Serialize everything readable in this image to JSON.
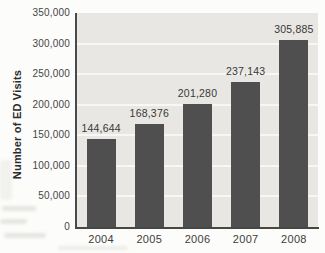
{
  "chart_data": {
    "type": "bar",
    "title": "",
    "categories": [
      "2004",
      "2005",
      "2006",
      "2007",
      "2008"
    ],
    "values": [
      144644,
      168376,
      201280,
      237143,
      305885
    ],
    "value_labels": [
      "144,644",
      "168,376",
      "201,280",
      "237,143",
      "305,885"
    ],
    "xlabel": "",
    "ylabel": "Number of ED Visits",
    "ylim": [
      0,
      350000
    ],
    "ytick_interval": 50000,
    "ytick_labels": [
      "0",
      "50,000",
      "100,000",
      "150,000",
      "200,000",
      "250,000",
      "300,000",
      "350,000"
    ],
    "grid": "horizontal-white",
    "legend": "none",
    "colors": {
      "bar": "#4f4f4f",
      "plot_background": "#e9e7e4",
      "gridline": "#f8f7f4",
      "axis_line": "#4a4a4a",
      "label_text": "#383838"
    }
  }
}
